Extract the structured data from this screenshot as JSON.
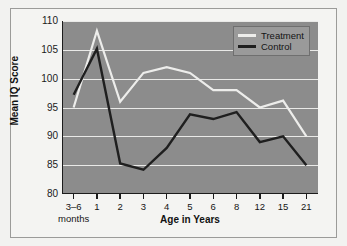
{
  "chart_data": {
    "type": "line",
    "title": "",
    "xlabel": "Age in Years",
    "ylabel": "Mean IQ Score",
    "categories": [
      "3–6",
      "1",
      "2",
      "3",
      "4",
      "5",
      "6",
      "8",
      "12",
      "15",
      "21"
    ],
    "x_sub_label": "months",
    "ylim": [
      80,
      110
    ],
    "yticks": [
      80,
      85,
      90,
      95,
      100,
      105,
      110
    ],
    "ytick_labels": [
      "80",
      "85",
      "90",
      "95",
      "100",
      "105",
      "110"
    ],
    "grid": true,
    "legend_position": "top-right",
    "series": [
      {
        "name": "Treatment",
        "color": "#ededeb",
        "values": [
          95,
          108.3,
          96,
          101,
          102,
          101,
          98,
          98,
          95,
          96.2,
          90
        ]
      },
      {
        "name": "Control",
        "color": "#1f1f1f",
        "values": [
          97.2,
          105.2,
          85.3,
          84.2,
          88,
          93.8,
          93,
          94.2,
          89,
          90,
          85
        ]
      }
    ]
  },
  "colors": {
    "plot_background": "#8c8c8c",
    "figure_background": "#f4f4f2",
    "gridline": "#e9e9e7",
    "axis": "#1c1c1c",
    "treatment": "#ededeb",
    "control": "#1f1f1f"
  },
  "legend": {
    "items": [
      {
        "label": "Treatment",
        "color": "#ededeb"
      },
      {
        "label": "Control",
        "color": "#1f1f1f"
      }
    ]
  }
}
